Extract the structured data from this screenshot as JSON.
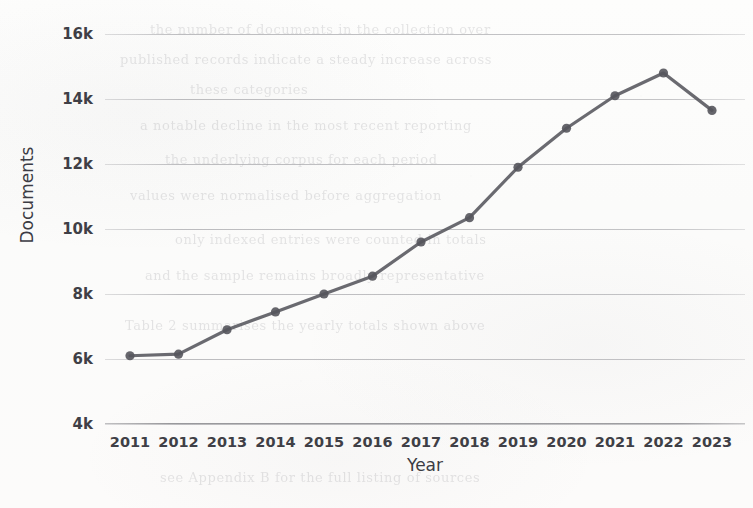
{
  "chart_data": {
    "type": "line",
    "title": "",
    "xlabel": "Year",
    "ylabel": "Documents",
    "categories": [
      "2011",
      "2012",
      "2013",
      "2014",
      "2015",
      "2016",
      "2017",
      "2018",
      "2019",
      "2020",
      "2021",
      "2022",
      "2023"
    ],
    "x": [
      2011,
      2012,
      2013,
      2014,
      2015,
      2016,
      2017,
      2018,
      2019,
      2020,
      2021,
      2022,
      2023
    ],
    "values": [
      6100,
      6150,
      6900,
      7450,
      8000,
      8550,
      9600,
      10350,
      11900,
      13100,
      14100,
      14800,
      13650
    ],
    "series": [
      {
        "name": "Documents",
        "values": [
          6100,
          6150,
          6900,
          7450,
          8000,
          8550,
          9600,
          10350,
          11900,
          13100,
          14100,
          14800,
          13650
        ]
      }
    ],
    "ytick_labels": [
      "16k",
      "14k",
      "12k",
      "10k",
      "8k",
      "6k",
      "4k"
    ],
    "ytick_values": [
      16000,
      14000,
      12000,
      10000,
      8000,
      6000,
      4000
    ],
    "ylim": [
      4000,
      16000
    ],
    "xlim": [
      2011,
      2023
    ],
    "grid": true,
    "grid_axis": "y",
    "legend": "none",
    "marker": "circle",
    "line_color": "#55555c",
    "marker_color": "#55555c",
    "grid_color": "#9a9a9f",
    "background_color": "#fcfcfb",
    "annotations": []
  },
  "ghost_text": {
    "lines": [
      "the number of documents in the collection over",
      "published records indicate a steady increase across",
      "these categories",
      "a notable decline in the most recent reporting",
      "the underlying corpus for each period",
      "values were normalised before aggregation",
      "only indexed entries were counted in totals",
      "and the sample remains broadly representative",
      "Table 2 summarises the yearly totals shown above",
      "see Appendix B for the full listing of sources"
    ]
  }
}
